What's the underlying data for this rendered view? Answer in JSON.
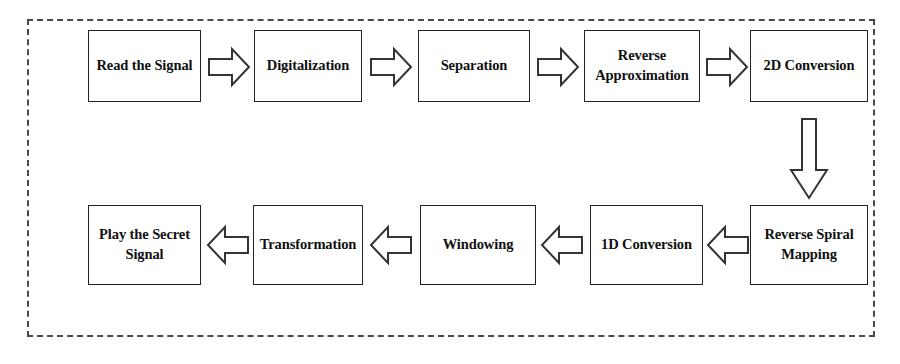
{
  "diagram": {
    "frame": {
      "style": "dashed",
      "color": "#4a4a4a"
    },
    "node_border_color": "#222222",
    "node_fill_color": "#ffffff",
    "arrow_stroke_color": "#333333",
    "arrow_fill_color": "#ffffff",
    "nodes": [
      {
        "id": "read-the-signal",
        "label": "Read the Signal",
        "row": "top",
        "order": 1
      },
      {
        "id": "digitalization",
        "label": "Digitalization",
        "row": "top",
        "order": 2
      },
      {
        "id": "separation",
        "label": "Separation",
        "row": "top",
        "order": 3
      },
      {
        "id": "reverse-approximation",
        "label": "Reverse\nApproximation",
        "row": "top",
        "order": 4
      },
      {
        "id": "2d-conversion",
        "label": "2D Conversion",
        "row": "top",
        "order": 5
      },
      {
        "id": "reverse-spiral-mapping",
        "label": "Reverse Spiral\nMapping",
        "row": "bottom",
        "order": 6
      },
      {
        "id": "1d-conversion",
        "label": "1D Conversion",
        "row": "bottom",
        "order": 7
      },
      {
        "id": "windowing",
        "label": "Windowing",
        "row": "bottom",
        "order": 8
      },
      {
        "id": "transformation",
        "label": "Transformation",
        "row": "bottom",
        "order": 9
      },
      {
        "id": "play-the-secret-signal",
        "label": "Play the Secret\nSignal",
        "row": "bottom",
        "order": 10
      }
    ],
    "connectors": [
      {
        "id": "arrow-read-to-digitalization",
        "from": "read-the-signal",
        "to": "digitalization",
        "direction": "right"
      },
      {
        "id": "arrow-digitalization-to-separation",
        "from": "digitalization",
        "to": "separation",
        "direction": "right"
      },
      {
        "id": "arrow-separation-to-reverse-approximation",
        "from": "separation",
        "to": "reverse-approximation",
        "direction": "right"
      },
      {
        "id": "arrow-reverse-approximation-to-2d",
        "from": "reverse-approximation",
        "to": "2d-conversion",
        "direction": "right"
      },
      {
        "id": "arrow-2d-to-reverse-spiral",
        "from": "2d-conversion",
        "to": "reverse-spiral-mapping",
        "direction": "down"
      },
      {
        "id": "arrow-reverse-spiral-to-1d",
        "from": "reverse-spiral-mapping",
        "to": "1d-conversion",
        "direction": "left"
      },
      {
        "id": "arrow-1d-to-windowing",
        "from": "1d-conversion",
        "to": "windowing",
        "direction": "left"
      },
      {
        "id": "arrow-windowing-to-transformation",
        "from": "windowing",
        "to": "transformation",
        "direction": "left"
      },
      {
        "id": "arrow-transformation-to-play",
        "from": "transformation",
        "to": "play-the-secret-signal",
        "direction": "left"
      }
    ]
  }
}
